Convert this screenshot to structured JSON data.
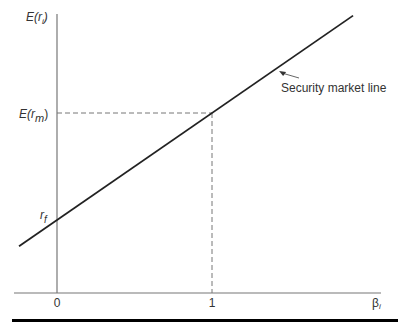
{
  "chart_data": {
    "type": "line",
    "title": "",
    "xlabel": "β_i",
    "ylabel": "E(r_i)",
    "x_ticks": [
      {
        "value": 0,
        "label": "0"
      },
      {
        "value": 1,
        "label": "1"
      }
    ],
    "y_ticks": [
      {
        "value": 0,
        "label": "r_f"
      },
      {
        "value": 1,
        "label": "E(r_m)"
      }
    ],
    "xlim": [
      -0.26,
      1.95
    ],
    "ylim": [
      -0.68,
      1.0
    ],
    "series": [
      {
        "name": "Security market line",
        "x": [
          -0.245,
          1.91
        ],
        "y": [
          -0.24,
          1.92
        ]
      }
    ],
    "reference_lines": [
      {
        "type": "horizontal-dashed",
        "y": 1,
        "x_from": 0,
        "x_to": 1
      },
      {
        "type": "vertical-dashed",
        "x": 1,
        "y_from": 1,
        "y_to": "axis"
      }
    ],
    "annotations": [
      {
        "text": "Security market line",
        "points_to": {
          "x": 1.42,
          "y": 1.42
        }
      }
    ],
    "grid": false,
    "legend": "none"
  },
  "labels": {
    "y_axis_main": "E(",
    "y_axis_var": "r",
    "y_axis_sub": "i",
    "y_axis_close": ")",
    "erm_main": "E(",
    "erm_var": "r",
    "erm_sub": "m",
    "erm_close": ")",
    "rf_var": "r",
    "rf_sub": "f",
    "x_zero": "0",
    "x_one": "1",
    "beta": "β",
    "beta_sub": "i",
    "sml": "Security market line"
  }
}
